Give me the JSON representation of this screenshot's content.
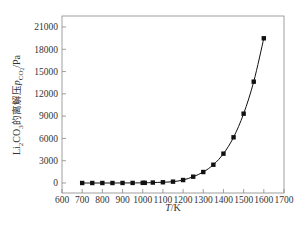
{
  "chart_data": {
    "type": "line",
    "title": "",
    "xlabel": "T/K",
    "ylabel": "Li2CO3的离解压 p_CO2/Pa",
    "ylabel_parts": {
      "prefix": "Li",
      "sub1": "2",
      "mid": "CO",
      "sub2": "3",
      "cn": "的离解压",
      "p": "p",
      "psub": "CO",
      "psub2": "2",
      "unit": "/Pa"
    },
    "xlim": [
      600,
      1700
    ],
    "ylim": [
      -1400,
      22400
    ],
    "xticks": [
      600,
      700,
      800,
      900,
      1000,
      1100,
      1200,
      1300,
      1400,
      1500,
      1600,
      1700
    ],
    "yticks": [
      0,
      3000,
      6000,
      9000,
      12000,
      15000,
      18000,
      21000
    ],
    "grid": false,
    "legend": null,
    "series": [
      {
        "name": "Li2CO3 decomposition pressure",
        "marker": "square",
        "color": "#111111",
        "x": [
          700,
          750,
          800,
          850,
          900,
          950,
          1000,
          1010,
          1050,
          1100,
          1150,
          1200,
          1250,
          1300,
          1350,
          1400,
          1450,
          1500,
          1550,
          1600
        ],
        "values": [
          0,
          0,
          0,
          0,
          5,
          10,
          20,
          25,
          60,
          100,
          180,
          400,
          850,
          1480,
          2460,
          3950,
          6150,
          9330,
          13640,
          19480
        ]
      }
    ]
  }
}
